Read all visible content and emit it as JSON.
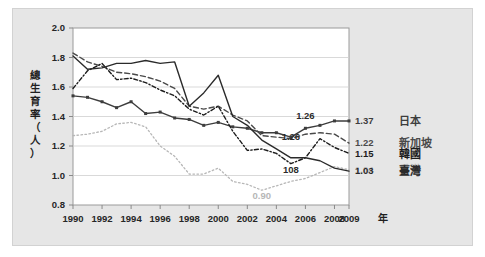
{
  "chart_data": {
    "type": "line",
    "title": "",
    "subtitle": "",
    "xlabel": "年",
    "ylabel": "總生育率（人）",
    "ylabel_chars": [
      "總",
      "生",
      "育",
      "率",
      "（",
      "人",
      "）"
    ],
    "x": [
      1990,
      1991,
      1992,
      1993,
      1994,
      1995,
      1996,
      1997,
      1998,
      1999,
      2000,
      2001,
      2002,
      2003,
      2004,
      2005,
      2006,
      2007,
      2008,
      2009
    ],
    "xlim": [
      1990,
      2009
    ],
    "ylim": [
      0.8,
      2.0
    ],
    "xticks": [
      1990,
      1992,
      1994,
      1996,
      1998,
      2000,
      2002,
      2004,
      2006,
      2008,
      2009
    ],
    "xtick_labels": [
      "1990",
      "1992",
      "1994",
      "1996",
      "1998",
      "2000",
      "2002",
      "2004",
      "2006",
      "2008",
      "2009"
    ],
    "yticks": [
      0.8,
      1.0,
      1.2,
      1.4,
      1.6,
      1.8,
      2.0
    ],
    "ytick_labels": [
      "0.8",
      "1.0",
      "1.2",
      "1.4",
      "1.6",
      "1.8",
      "2.0"
    ],
    "grid": true,
    "grid_axis": "y",
    "legend_position": "right",
    "plot_bg": "#ffffff",
    "panel_bg": "#e6e6e6",
    "series": [
      {
        "name": "日本",
        "legend_label": "日本",
        "style": "solid",
        "color": "#3d3d3d",
        "marker": "square",
        "end_label": "1.37",
        "values": [
          1.54,
          1.53,
          1.5,
          1.46,
          1.5,
          1.42,
          1.43,
          1.39,
          1.38,
          1.34,
          1.36,
          1.33,
          1.32,
          1.29,
          1.29,
          1.26,
          1.32,
          1.34,
          1.37,
          1.37
        ]
      },
      {
        "name": "新加坡",
        "legend_label": "新加坡",
        "style": "dashed",
        "color": "#4a4a4a",
        "marker": "none",
        "end_label": "1.22",
        "values": [
          1.83,
          1.77,
          1.74,
          1.7,
          1.69,
          1.67,
          1.64,
          1.59,
          1.47,
          1.45,
          1.47,
          1.41,
          1.37,
          1.27,
          1.26,
          1.25,
          1.28,
          1.29,
          1.28,
          1.22
        ]
      },
      {
        "name": "韓國",
        "legend_label": "韓國",
        "style": "dotted-dash",
        "color": "#1c1c1c",
        "marker": "none",
        "end_label": "1.15",
        "values": [
          1.59,
          1.71,
          1.76,
          1.65,
          1.66,
          1.63,
          1.58,
          1.54,
          1.45,
          1.41,
          1.47,
          1.3,
          1.17,
          1.18,
          1.15,
          1.08,
          1.12,
          1.25,
          1.19,
          1.15
        ]
      },
      {
        "name": "香港",
        "legend_label": "香港",
        "style": "dotted",
        "color": "#b7b7b7",
        "marker": "none",
        "end_label": "1.04",
        "annotation": "0.90",
        "values": [
          1.27,
          1.28,
          1.3,
          1.35,
          1.36,
          1.33,
          1.2,
          1.13,
          1.01,
          1.01,
          1.05,
          0.96,
          0.94,
          0.9,
          0.93,
          0.96,
          0.98,
          1.02,
          1.06,
          1.04
        ]
      },
      {
        "name": "臺灣",
        "legend_label": "臺灣",
        "style": "solid",
        "color": "#2b2b2b",
        "marker": "none",
        "end_label": "1.03",
        "values": [
          1.81,
          1.72,
          1.73,
          1.76,
          1.76,
          1.78,
          1.76,
          1.77,
          1.47,
          1.56,
          1.68,
          1.4,
          1.34,
          1.24,
          1.18,
          1.12,
          1.12,
          1.1,
          1.05,
          1.03
        ]
      }
    ],
    "annotations": [
      {
        "text": "1.26",
        "x": 2006,
        "y": 1.38,
        "color": "#2b2b2b",
        "series": "日本"
      },
      {
        "text": "1.26",
        "x": 2005,
        "y": 1.24,
        "color": "#2b2b2b",
        "series": "新加坡"
      },
      {
        "text": "108",
        "x": 2005,
        "y": 1.02,
        "color": "#2b2b2b",
        "series": "韓國"
      },
      {
        "text": "0.90",
        "x": 2003,
        "y": 0.84,
        "color": "#b7b7b7",
        "series": "香港"
      }
    ]
  }
}
